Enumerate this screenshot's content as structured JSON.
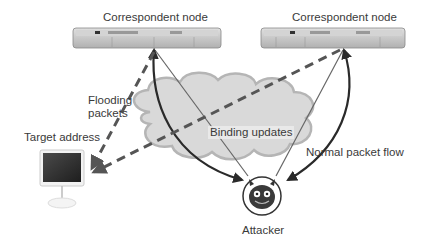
{
  "diagram": {
    "title": "",
    "nodes": {
      "correspondent_left": {
        "label": "Correspondent node",
        "type": "rack-server"
      },
      "correspondent_right": {
        "label": "Correspondent node",
        "type": "rack-server"
      },
      "target": {
        "label": "Target address",
        "type": "desktop-computer"
      },
      "attacker": {
        "label": "Attacker",
        "type": "devil-face-icon"
      },
      "network": {
        "label": "",
        "type": "cloud"
      }
    },
    "edges": [
      {
        "from": "attacker",
        "to": "correspondent_left",
        "style": "thin-solid",
        "meaning": "Binding updates"
      },
      {
        "from": "attacker",
        "to": "correspondent_right",
        "style": "thin-solid",
        "meaning": "Binding updates"
      },
      {
        "from": "correspondent_left",
        "to": "attacker",
        "style": "thick-curved-bidirectional",
        "meaning": "Normal packet flow"
      },
      {
        "from": "correspondent_right",
        "to": "attacker",
        "style": "thick-curved-bidirectional",
        "meaning": "Normal packet flow"
      },
      {
        "from": "correspondent_left",
        "to": "target",
        "style": "dashed",
        "meaning": "Flooding packets"
      },
      {
        "from": "correspondent_right",
        "to": "target",
        "style": "dashed",
        "meaning": "Flooding packets"
      }
    ],
    "labels": {
      "flooding": "Flooding packets",
      "flooding_line1": "Flooding",
      "flooding_line2": "packets",
      "binding": "Binding updates",
      "normal_flow": "Normal packet flow"
    },
    "colors": {
      "cloud_fill": "#d9d9d9",
      "cloud_stroke": "#b5b5b5",
      "arrow_dark": "#2a2a2a",
      "arrow_thin": "#666666",
      "dashed": "#555555",
      "server_body": "#c8c8c8"
    }
  }
}
